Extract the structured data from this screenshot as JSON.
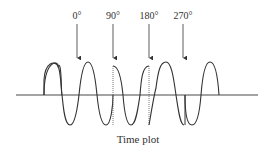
{
  "diagram": {
    "caption": "Time plot",
    "markers": [
      {
        "label": "0°",
        "x": 77
      },
      {
        "label": "90°",
        "x": 113
      },
      {
        "label": "180°",
        "x": 149
      },
      {
        "label": "270°",
        "x": 183
      }
    ],
    "colors": {
      "line": "#333333",
      "background": "#ffffff"
    }
  }
}
